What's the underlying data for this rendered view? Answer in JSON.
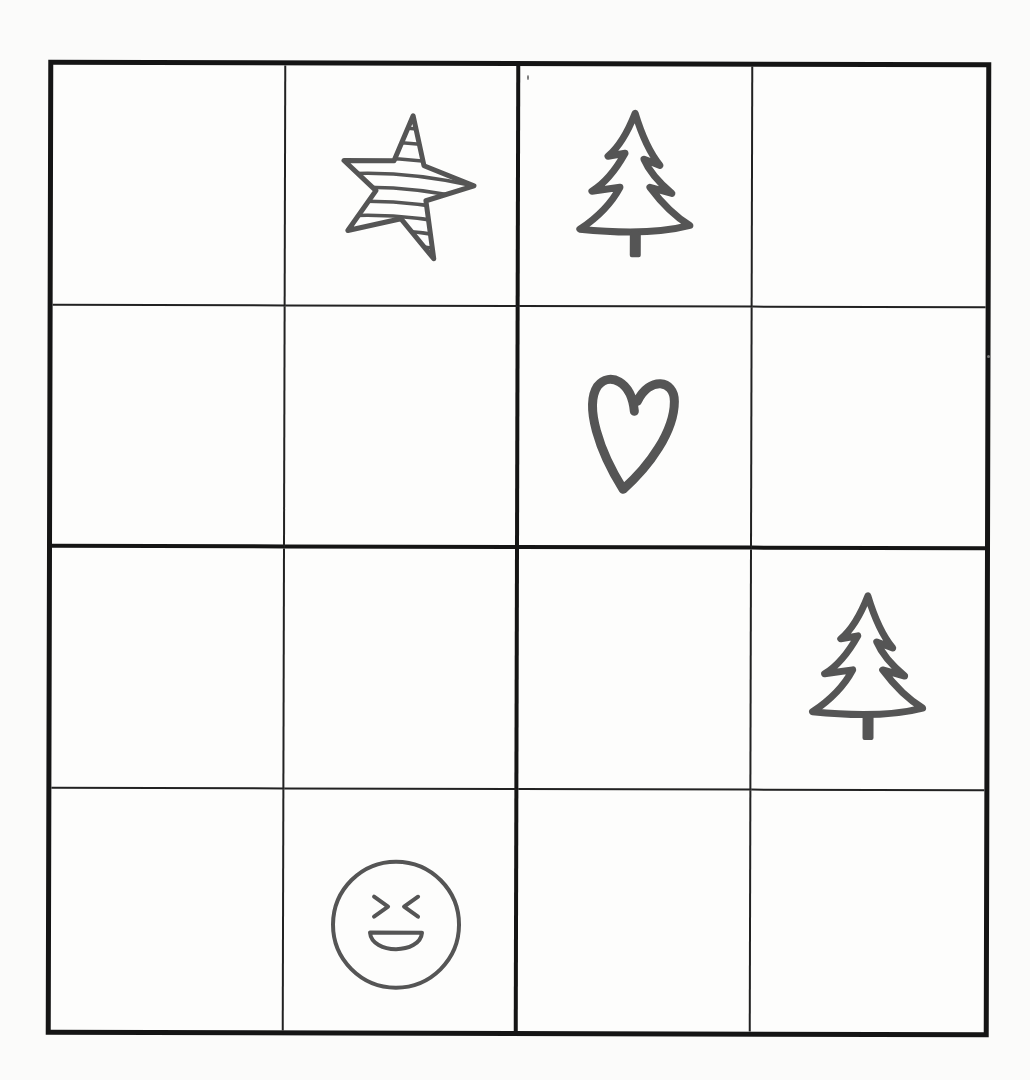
{
  "puzzle": {
    "type": "picture-sudoku-4x4",
    "size": 4,
    "box_size": 2,
    "symbols": [
      "star",
      "tree",
      "heart",
      "smiley"
    ],
    "colors": {
      "ink": "#555555",
      "grid": "#151515",
      "paper": "#fbfbfa"
    },
    "cells": [
      [
        "",
        "star",
        "tree",
        ""
      ],
      [
        "",
        "",
        "heart",
        ""
      ],
      [
        "",
        "",
        "",
        "tree"
      ],
      [
        "",
        "smiley",
        "",
        ""
      ]
    ]
  }
}
